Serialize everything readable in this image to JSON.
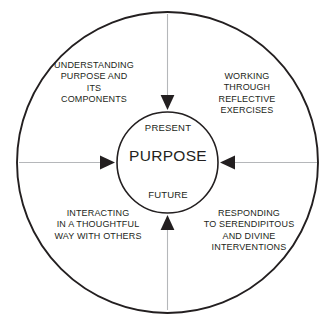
{
  "diagram": {
    "center": {
      "top_label": "PRESENT",
      "main_label": "PURPOSE",
      "bottom_label": "FUTURE"
    },
    "quadrants": [
      {
        "id": "top-left",
        "text": "UNDERSTANDING\nPURPOSE AND\nITS\nCOMPONENTS"
      },
      {
        "id": "top-right",
        "text": "WORKING\nTHROUGH\nREFLECTIVE\nEXERCISES"
      },
      {
        "id": "bottom-left",
        "text": "INTERACTING\nIN A THOUGHTFUL\nWAY WITH OTHERS"
      },
      {
        "id": "bottom-right",
        "text": "RESPONDING\nTO SERENDIPITOUS\nAND DIVINE\nINTERVENTIONS"
      }
    ],
    "arrows": [
      {
        "id": "arrow-top",
        "direction": "down"
      },
      {
        "id": "arrow-right",
        "direction": "left"
      },
      {
        "id": "arrow-bottom",
        "direction": "up"
      },
      {
        "id": "arrow-left",
        "direction": "right"
      }
    ],
    "colors": {
      "stroke": "#231f20",
      "arrow_line": "#a7a9ac",
      "text": "#231f20",
      "background": "#ffffff"
    }
  }
}
